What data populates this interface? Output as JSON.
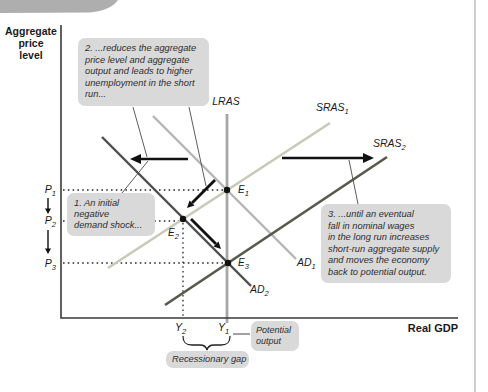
{
  "figure": {
    "axes": {
      "y_label": "Aggregate\nprice\nlevel",
      "x_label": "Real GDP"
    },
    "curves": {
      "lras": {
        "label": "LRAS",
        "sub": "",
        "color": "#a6a6a6"
      },
      "sras1": {
        "label": "SRAS",
        "sub": "1",
        "color": "#c6cab6"
      },
      "sras2": {
        "label": "SRAS",
        "sub": "2",
        "color": "#565a4b"
      },
      "ad1": {
        "label": "AD",
        "sub": "1",
        "color": "#b5b5b5"
      },
      "ad2": {
        "label": "AD",
        "sub": "2",
        "color": "#4e4e4e"
      }
    },
    "points": {
      "e1": {
        "label": "E",
        "sub": "1"
      },
      "e2": {
        "label": "E",
        "sub": "2"
      },
      "e3": {
        "label": "E",
        "sub": "3"
      }
    },
    "ticks": {
      "p1": {
        "label": "P",
        "sub": "1"
      },
      "p2": {
        "label": "P",
        "sub": "2"
      },
      "p3": {
        "label": "P",
        "sub": "3"
      },
      "y2": {
        "label": "Y",
        "sub": "2"
      },
      "y1": {
        "label": "Y",
        "sub": "1"
      }
    },
    "callouts": {
      "note1": "1. An initial\nnegative\ndemand shock...",
      "note2": "2. ...reduces the aggregate\nprice level and aggregate\noutput and leads to higher\nunemployment in the short\nrun...",
      "note3": "3. ...until an eventual\nfall in nominal wages\nin the long run increases\nshort-run aggregate supply\nand moves the economy\nback to potential output."
    },
    "labels": {
      "potential_output": "Potential\noutput",
      "recessionary_gap": "Recessionary gap"
    },
    "colors": {
      "axis": "#3a3a3a",
      "arrow": "#111111",
      "callout_bg": "#d9d9d9",
      "page_edge": "#cfcfcf",
      "swoosh": "#aeaeae"
    }
  }
}
